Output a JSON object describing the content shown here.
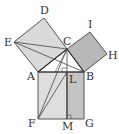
{
  "diagram": {
    "type": "geometry-figure",
    "points": {
      "A": [
        38,
        72
      ],
      "B": [
        84,
        72
      ],
      "C": [
        67,
        49
      ],
      "D": [
        44,
        18
      ],
      "E": [
        14,
        42
      ],
      "I": [
        90,
        32
      ],
      "H": [
        107,
        54
      ],
      "F": [
        38,
        119
      ],
      "G": [
        84,
        119
      ],
      "L": [
        67,
        72
      ],
      "M": [
        67,
        119
      ]
    },
    "labels": {
      "A": "A",
      "B": "B",
      "C": "C",
      "D": "D",
      "E": "E",
      "F": "F",
      "G": "G",
      "H": "H",
      "I": "I",
      "L": "L",
      "M": "M"
    },
    "colors": {
      "square_ACDE": "#d9d9d9",
      "square_BCIH": "#b5b5b5",
      "rect_AFML": "#dcdcdc",
      "rect_LMGB": "#c2c2c2",
      "stroke": "#444444"
    }
  }
}
